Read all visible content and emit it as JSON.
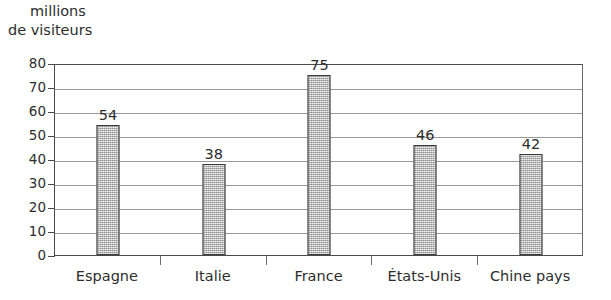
{
  "chart_data": {
    "type": "bar",
    "title": "",
    "subtitle": "",
    "categories": [
      "Espagne",
      "Italie",
      "France",
      "États-Unis",
      "Chine pays"
    ],
    "values": [
      54,
      38,
      75,
      46,
      42
    ],
    "data_labels": [
      "54",
      "38",
      "75",
      "46",
      "42"
    ],
    "xlabel": "",
    "ylabel": "millions de visiteurs",
    "ylabel_lines": [
      "millions",
      "de visiteurs"
    ],
    "ylim": [
      0,
      80
    ],
    "ytick_values": [
      80,
      70,
      60,
      50,
      40,
      30,
      20,
      10,
      0
    ],
    "ytick_labels": [
      "80",
      "70",
      "60",
      "50",
      "40",
      "30",
      "20",
      "10",
      "0"
    ],
    "ytick_step": 10,
    "grid": true,
    "grid_axis": "y",
    "legend": false,
    "legend_position": "none",
    "bar_fill_color": "#b0b0b0",
    "bar_border_color": "#3a3a3a",
    "grid_color": "#9a9a9a",
    "axis_color": "#4a4a4a",
    "background_color": "#ffffff",
    "text_color": "#2d2d2d"
  }
}
